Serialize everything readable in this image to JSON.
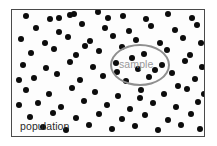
{
  "figure": {
    "type": "population-sample-diagram",
    "width": 217,
    "height": 146,
    "background_color": "#ffffff"
  },
  "population_box": {
    "label": "population",
    "border_color": "#4a4a4a",
    "fill_color": "#fdfdfd",
    "x": 11,
    "y": 9,
    "width": 194,
    "height": 128
  },
  "sample_region": {
    "label": "sample",
    "shape": "ellipse",
    "stroke_color": "#8f8f8f",
    "text_color": "#9a9a9a",
    "x": 98,
    "y": 34,
    "width": 60,
    "height": 42
  },
  "dots": {
    "color": "#0c0c0c",
    "radius": 3,
    "count": 96,
    "points": [
      [
        14,
        6
      ],
      [
        38,
        9
      ],
      [
        62,
        4
      ],
      [
        86,
        2
      ],
      [
        111,
        6
      ],
      [
        134,
        9
      ],
      [
        156,
        4
      ],
      [
        180,
        8
      ],
      [
        24,
        18
      ],
      [
        47,
        22
      ],
      [
        70,
        14
      ],
      [
        93,
        18
      ],
      [
        117,
        21
      ],
      [
        139,
        16
      ],
      [
        163,
        20
      ],
      [
        185,
        15
      ],
      [
        9,
        29
      ],
      [
        33,
        33
      ],
      [
        56,
        27
      ],
      [
        78,
        31
      ],
      [
        101,
        26
      ],
      [
        124,
        30
      ],
      [
        148,
        33
      ],
      [
        171,
        28
      ],
      [
        189,
        33
      ],
      [
        19,
        43
      ],
      [
        42,
        39
      ],
      [
        64,
        45
      ],
      [
        87,
        41
      ],
      [
        110,
        37
      ],
      [
        132,
        44
      ],
      [
        155,
        40
      ],
      [
        178,
        45
      ],
      [
        11,
        55
      ],
      [
        34,
        58
      ],
      [
        58,
        52
      ],
      [
        81,
        57
      ],
      [
        104,
        53
      ],
      [
        126,
        59
      ],
      [
        150,
        55
      ],
      [
        173,
        51
      ],
      [
        190,
        57
      ],
      [
        22,
        68
      ],
      [
        45,
        64
      ],
      [
        68,
        70
      ],
      [
        91,
        66
      ],
      [
        114,
        71
      ],
      [
        137,
        67
      ],
      [
        160,
        63
      ],
      [
        183,
        69
      ],
      [
        14,
        80
      ],
      [
        37,
        84
      ],
      [
        60,
        78
      ],
      [
        83,
        82
      ],
      [
        106,
        86
      ],
      [
        129,
        80
      ],
      [
        152,
        84
      ],
      [
        175,
        79
      ],
      [
        192,
        84
      ],
      [
        26,
        93
      ],
      [
        49,
        97
      ],
      [
        72,
        91
      ],
      [
        95,
        95
      ],
      [
        118,
        99
      ],
      [
        141,
        93
      ],
      [
        164,
        97
      ],
      [
        186,
        92
      ],
      [
        18,
        107
      ],
      [
        41,
        103
      ],
      [
        64,
        108
      ],
      [
        87,
        104
      ],
      [
        110,
        109
      ],
      [
        133,
        105
      ],
      [
        156,
        110
      ],
      [
        179,
        104
      ],
      [
        31,
        117
      ],
      [
        54,
        120
      ],
      [
        77,
        115
      ],
      [
        100,
        119
      ],
      [
        123,
        116
      ],
      [
        146,
        120
      ],
      [
        169,
        115
      ],
      [
        188,
        119
      ],
      [
        47,
        8
      ],
      [
        73,
        36
      ],
      [
        96,
        8
      ],
      [
        120,
        48
      ],
      [
        143,
        60
      ],
      [
        105,
        62
      ],
      [
        128,
        88
      ],
      [
        166,
        76
      ],
      [
        7,
        70
      ],
      [
        7,
        95
      ],
      [
        195,
        45
      ],
      [
        196,
        70
      ],
      [
        58,
        5
      ]
    ]
  }
}
